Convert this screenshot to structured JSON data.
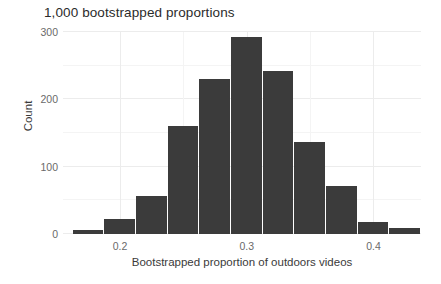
{
  "chart_data": {
    "type": "bar",
    "title": "1,000 bootstrapped proportions",
    "xlabel": "Bootstrapped proportion of outdoors videos",
    "ylabel": "Count",
    "bin_width": 0.025,
    "bin_starts": [
      0.1625,
      0.1875,
      0.2125,
      0.2375,
      0.2625,
      0.2875,
      0.3125,
      0.3375,
      0.3625,
      0.3875,
      0.4125
    ],
    "categories": [
      "0.163",
      "0.188",
      "0.213",
      "0.238",
      "0.263",
      "0.288",
      "0.313",
      "0.338",
      "0.363",
      "0.388",
      "0.413"
    ],
    "values": [
      6,
      22,
      57,
      160,
      230,
      292,
      242,
      136,
      71,
      18,
      9
    ],
    "xlim": [
      0.155,
      0.4375
    ],
    "ylim": [
      0,
      300
    ],
    "xticks": [
      0.2,
      0.3,
      0.4
    ],
    "xtick_labels": [
      "0.2",
      "0.3",
      "0.4"
    ],
    "yticks": [
      0,
      100,
      200,
      300
    ],
    "ytick_labels": [
      "0",
      "100",
      "200",
      "300"
    ],
    "grid": true,
    "legend": null,
    "bar_color": "#3b3b3b",
    "grid_color": "#ececec",
    "background": "#ffffff"
  },
  "axes": {
    "y_tick_labels": [
      "300",
      "200",
      "100",
      "0"
    ],
    "x_tick_labels": [
      "0.2",
      "0.3",
      "0.4"
    ],
    "y_title": "Count",
    "x_title": "Bootstrapped proportion of outdoors videos"
  },
  "header": {
    "title": "1,000 bootstrapped proportions"
  }
}
